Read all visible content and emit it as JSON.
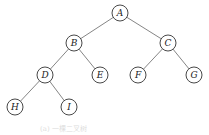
{
  "diagram": {
    "type": "binary-tree",
    "nodes": [
      {
        "id": "A",
        "label": "A",
        "x": 120,
        "y": 13
      },
      {
        "id": "B",
        "label": "B",
        "x": 74,
        "y": 43
      },
      {
        "id": "C",
        "label": "C",
        "x": 168,
        "y": 43
      },
      {
        "id": "D",
        "label": "D",
        "x": 45,
        "y": 75
      },
      {
        "id": "E",
        "label": "E",
        "x": 100,
        "y": 75
      },
      {
        "id": "F",
        "label": "F",
        "x": 138,
        "y": 75
      },
      {
        "id": "G",
        "label": "G",
        "x": 194,
        "y": 75
      },
      {
        "id": "H",
        "label": "H",
        "x": 15,
        "y": 107
      },
      {
        "id": "I",
        "label": "I",
        "x": 69,
        "y": 107
      }
    ],
    "edges": [
      [
        "A",
        "B"
      ],
      [
        "A",
        "C"
      ],
      [
        "B",
        "D"
      ],
      [
        "B",
        "E"
      ],
      [
        "C",
        "F"
      ],
      [
        "C",
        "G"
      ],
      [
        "D",
        "H"
      ],
      [
        "D",
        "I"
      ]
    ],
    "caption": "(a) 一棵二叉树"
  }
}
